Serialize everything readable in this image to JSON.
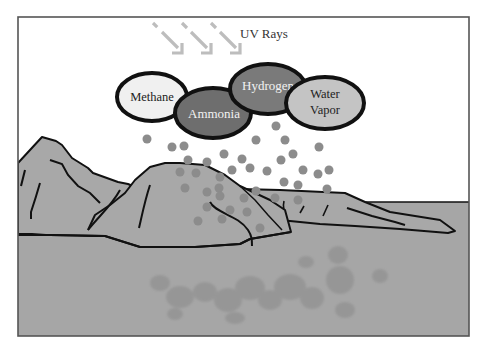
{
  "diagram": {
    "uv_label": "UV Rays",
    "gases": [
      {
        "label": "Methane",
        "lines": [
          "Methane"
        ],
        "fill": "#f0f0f0",
        "text_color": "#222222"
      },
      {
        "label": "Ammonia",
        "lines": [
          "Ammonia"
        ],
        "fill": "#6e6e6e",
        "text_color": "#f2f2f2"
      },
      {
        "label": "Hydrogen",
        "lines": [
          "Hydrogen"
        ],
        "fill": "#7a7a7a",
        "text_color": "#f2f2f2"
      },
      {
        "label": "Water Vapor",
        "lines": [
          "Water",
          "Vapor"
        ],
        "fill": "#c4c4c4",
        "text_color": "#222222"
      }
    ],
    "colors": {
      "frame": "#555555",
      "sky": "#ffffff",
      "land": "#a8a8a8",
      "sea": "#a6a6a6",
      "outline": "#111111",
      "droplet": "#8c8c8c",
      "uv_arrow": "#bdbdbd",
      "organic_cloud": "#8a8a8a"
    },
    "elements": {
      "landmass": "Rocky landmasses",
      "ocean": "Primordial ocean",
      "rain": "Rain droplets",
      "organic": "Organic molecule cloud"
    }
  }
}
